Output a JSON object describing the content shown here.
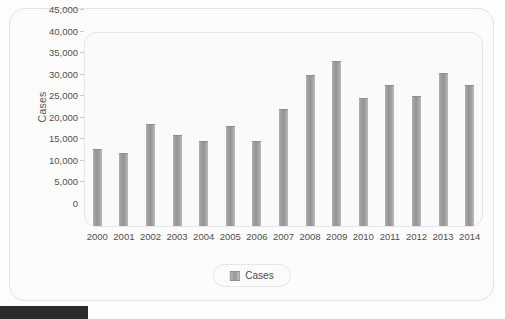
{
  "chart_data": {
    "type": "bar",
    "title": "",
    "xlabel": "",
    "ylabel": "Cases",
    "categories": [
      "2000",
      "2001",
      "2002",
      "2003",
      "2004",
      "2005",
      "2006",
      "2007",
      "2008",
      "2009",
      "2010",
      "2011",
      "2012",
      "2013",
      "2014"
    ],
    "values": [
      17800,
      17000,
      23700,
      21200,
      19700,
      23100,
      19800,
      27200,
      35000,
      38200,
      29800,
      32600,
      30200,
      35600,
      32800
    ],
    "series": [
      {
        "name": "Cases",
        "values": [
          17800,
          17000,
          23700,
          21200,
          19700,
          23100,
          19800,
          27200,
          35000,
          38200,
          29800,
          32600,
          30200,
          35600,
          32800
        ]
      }
    ],
    "ylim": [
      0,
      45000
    ],
    "y_ticks": [
      0,
      5000,
      10000,
      15000,
      20000,
      25000,
      30000,
      35000,
      40000,
      45000
    ],
    "y_tick_labels": [
      "0",
      "5,000",
      "10,000",
      "15,000",
      "20,000",
      "25,000",
      "30,000",
      "35,000",
      "40,000",
      "45,000"
    ],
    "grid": false,
    "legend_position": "bottom",
    "bar_color": "#989898"
  },
  "legend": {
    "entries": [
      {
        "label": "Cases",
        "color": "#989898"
      }
    ]
  },
  "axis": {
    "y_title": "Cases"
  }
}
